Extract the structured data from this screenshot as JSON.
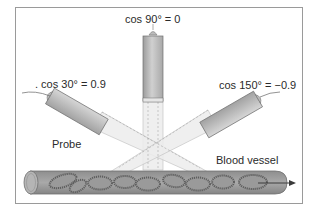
{
  "diagram": {
    "type": "doppler-ultrasound-angle-illustration",
    "probes": [
      {
        "id": "probe-30",
        "angle_deg": 30,
        "cos_label": ". cos 30° = 0.9"
      },
      {
        "id": "probe-90",
        "angle_deg": 90,
        "cos_label": "cos 90° = 0"
      },
      {
        "id": "probe-150",
        "angle_deg": 150,
        "cos_label": "cos 150° = −0.9"
      }
    ],
    "labels": {
      "probe": "Probe",
      "vessel": "Blood vessel"
    },
    "flow_direction": "right",
    "colors": {
      "frame": "#9a9a9a",
      "probe_body": "#b8b8b8",
      "probe_light": "#e4e4e4",
      "beam": "#ececec",
      "vessel_wall": "#8c8c8c",
      "vessel_fill": "#a0a0a0",
      "cells": "#6e6e6e",
      "text": "#2a2a2a"
    }
  }
}
